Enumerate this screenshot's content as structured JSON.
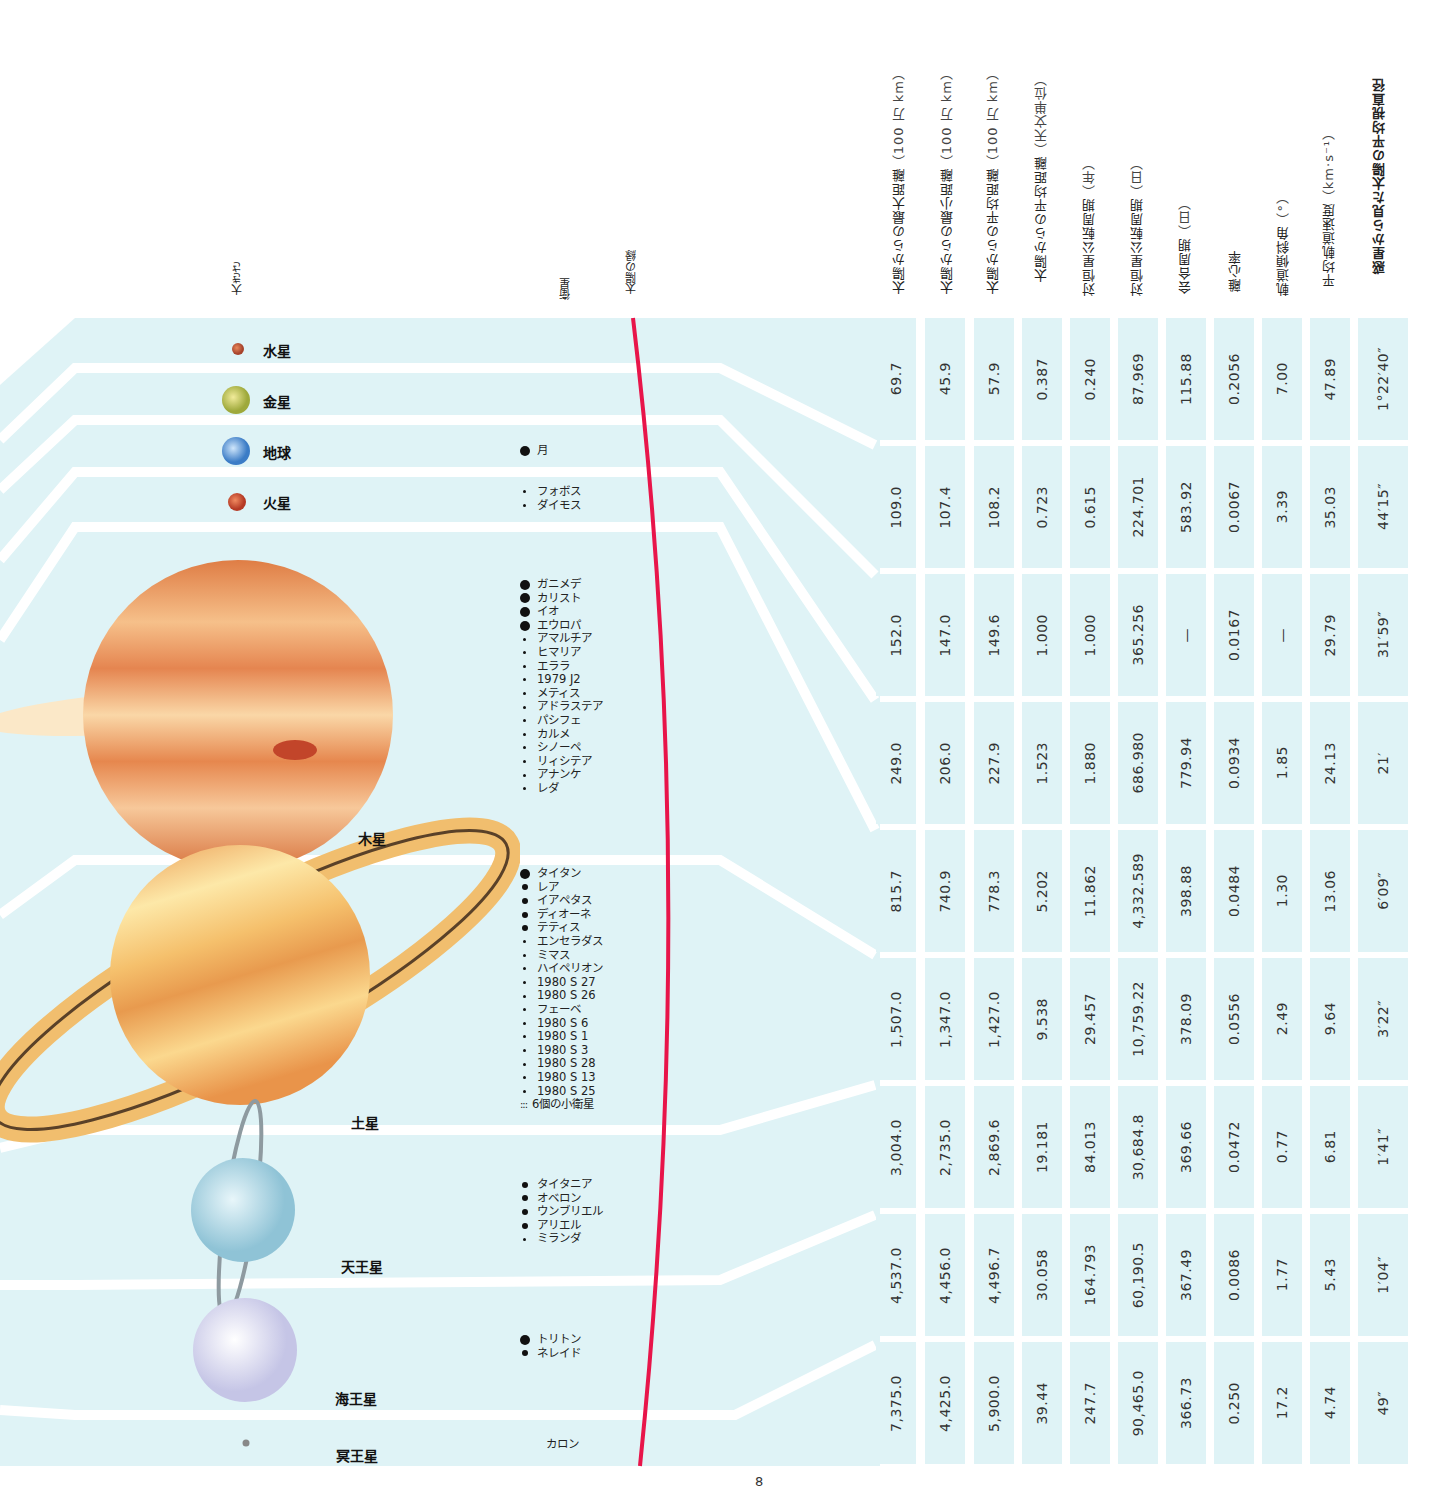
{
  "column_headers": {
    "size": "大きさ",
    "satellites": "衛星",
    "sun_edge": "太陽の縁"
  },
  "table_headers": [
    {
      "label": "太陽からの最大距離",
      "unit": "（100 万 km）"
    },
    {
      "label": "太陽からの最小距離",
      "unit": "（100 万 km）"
    },
    {
      "label": "太陽からの平均距離",
      "unit": "（100 万 km）"
    },
    {
      "label": "太陽からの平均距離",
      "unit": "（天文単位）"
    },
    {
      "label": "対恒星公転周期",
      "unit": "（年）"
    },
    {
      "label": "対恒星公転周期",
      "unit": "（日）"
    },
    {
      "label": "会合周期",
      "unit": "（日）"
    },
    {
      "label": "離心率",
      "unit": ""
    },
    {
      "label": "軌道傾斜角",
      "unit": "（°）"
    },
    {
      "label": "平均軌道速度",
      "unit": "（km·s⁻¹）"
    },
    {
      "label": "惑星から見た太陽の平均視直径",
      "unit": ""
    }
  ],
  "planets": [
    {
      "name": "水星",
      "color": "#c0553a"
    },
    {
      "name": "金星",
      "color": "#c9c65a"
    },
    {
      "name": "地球",
      "color": "#5b95d6"
    },
    {
      "name": "火星",
      "color": "#cf4f33"
    },
    {
      "name": "木星",
      "color": "#e38a4a"
    },
    {
      "name": "土星",
      "color": "#efb25a"
    },
    {
      "name": "天王星",
      "color": "#a9d6e4"
    },
    {
      "name": "海王星",
      "color": "#dcdcef"
    },
    {
      "name": "冥王星",
      "color": "#8a8a8a"
    }
  ],
  "satellites": {
    "earth": [
      {
        "name": "月",
        "size": "lg"
      }
    ],
    "mars": [
      {
        "name": "フォボス",
        "size": "sm"
      },
      {
        "name": "ダイモス",
        "size": "sm"
      }
    ],
    "jupiter": [
      {
        "name": "ガニメデ",
        "size": "lg"
      },
      {
        "name": "カリスト",
        "size": "lg"
      },
      {
        "name": "イオ",
        "size": "lg"
      },
      {
        "name": "エウロパ",
        "size": "lg"
      },
      {
        "name": "アマルチア",
        "size": "sm"
      },
      {
        "name": "ヒマリア",
        "size": "sm"
      },
      {
        "name": "エララ",
        "size": "sm"
      },
      {
        "name": "1979 J2",
        "size": "sm"
      },
      {
        "name": "メティス",
        "size": "sm"
      },
      {
        "name": "アドラステア",
        "size": "sm"
      },
      {
        "name": "パシフェ",
        "size": "sm"
      },
      {
        "name": "カルメ",
        "size": "sm"
      },
      {
        "name": "シノーペ",
        "size": "sm"
      },
      {
        "name": "リィシテア",
        "size": "sm"
      },
      {
        "name": "アナンケ",
        "size": "sm"
      },
      {
        "name": "レダ",
        "size": "sm"
      }
    ],
    "saturn": [
      {
        "name": "タイタン",
        "size": "lg"
      },
      {
        "name": "レア",
        "size": "md"
      },
      {
        "name": "イアペタス",
        "size": "md"
      },
      {
        "name": "ディオーネ",
        "size": "md"
      },
      {
        "name": "テティス",
        "size": "md"
      },
      {
        "name": "エンセラダス",
        "size": "sm"
      },
      {
        "name": "ミマス",
        "size": "sm"
      },
      {
        "name": "ハイペリオン",
        "size": "sm"
      },
      {
        "name": "1980 S 27",
        "size": "sm"
      },
      {
        "name": "1980 S 26",
        "size": "sm"
      },
      {
        "name": "フェーベ",
        "size": "sm"
      },
      {
        "name": "1980 S 6",
        "size": "sm"
      },
      {
        "name": "1980 S 1",
        "size": "sm"
      },
      {
        "name": "1980 S 3",
        "size": "sm"
      },
      {
        "name": "1980 S 28",
        "size": "sm"
      },
      {
        "name": "1980 S 13",
        "size": "sm"
      },
      {
        "name": "1980 S 25",
        "size": "sm"
      },
      {
        "name": "6個の小衛星",
        "size": "cluster",
        "marker": ":::"
      }
    ],
    "uranus": [
      {
        "name": "タイタニア",
        "size": "md"
      },
      {
        "name": "オベロン",
        "size": "md"
      },
      {
        "name": "ウンブリエル",
        "size": "md"
      },
      {
        "name": "アリエル",
        "size": "md"
      },
      {
        "name": "ミランダ",
        "size": "sm"
      }
    ],
    "neptune": [
      {
        "name": "トリトン",
        "size": "lg"
      },
      {
        "name": "ネレイド",
        "size": "md"
      }
    ],
    "pluto": [
      {
        "name": "カロン",
        "size": "none"
      }
    ]
  },
  "table_rows": [
    {
      "planet": "水星",
      "values": [
        "69.7",
        "45.9",
        "57.9",
        "0.387",
        "0.240",
        "87.969",
        "115.88",
        "0.2056",
        "7.00",
        "47.89",
        "1°22′40″"
      ]
    },
    {
      "planet": "金星",
      "values": [
        "109.0",
        "107.4",
        "108.2",
        "0.723",
        "0.615",
        "224.701",
        "583.92",
        "0.0067",
        "3.39",
        "35.03",
        "44′15″"
      ]
    },
    {
      "planet": "地球",
      "values": [
        "152.0",
        "147.0",
        "149.6",
        "1.000",
        "1.000",
        "365.256",
        "—",
        "0.0167",
        "—",
        "29.79",
        "31′59″"
      ]
    },
    {
      "planet": "火星",
      "values": [
        "249.0",
        "206.0",
        "227.9",
        "1.523",
        "1.880",
        "686.980",
        "779.94",
        "0.0934",
        "1.85",
        "24.13",
        "21′"
      ]
    },
    {
      "planet": "木星",
      "values": [
        "815.7",
        "740.9",
        "778.3",
        "5.202",
        "11.862",
        "4,332.589",
        "398.88",
        "0.0484",
        "1.30",
        "13.06",
        "6′09″"
      ]
    },
    {
      "planet": "土星",
      "values": [
        "1,507.0",
        "1,347.0",
        "1,427.0",
        "9.538",
        "29.457",
        "10,759.22",
        "378.09",
        "0.0556",
        "2.49",
        "9.64",
        "3′22″"
      ]
    },
    {
      "planet": "天王星",
      "values": [
        "3,004.0",
        "2,735.0",
        "2,869.6",
        "19.181",
        "84.013",
        "30,684.8",
        "369.66",
        "0.0472",
        "0.77",
        "6.81",
        "1′41″"
      ]
    },
    {
      "planet": "海王星",
      "values": [
        "4,537.0",
        "4,456.0",
        "4,496.7",
        "30.058",
        "164.793",
        "60,190.5",
        "367.49",
        "0.0086",
        "1.77",
        "5.43",
        "1′04″"
      ]
    },
    {
      "planet": "冥王星",
      "values": [
        "7,375.0",
        "4,425.0",
        "5,900.0",
        "39.44",
        "247.7",
        "90,465.0",
        "366.73",
        "0.250",
        "17.2",
        "4.74",
        "49″"
      ]
    }
  ],
  "colors": {
    "band": "#dff3f6",
    "sun_edge": "#e8154a"
  },
  "page_number": "8"
}
